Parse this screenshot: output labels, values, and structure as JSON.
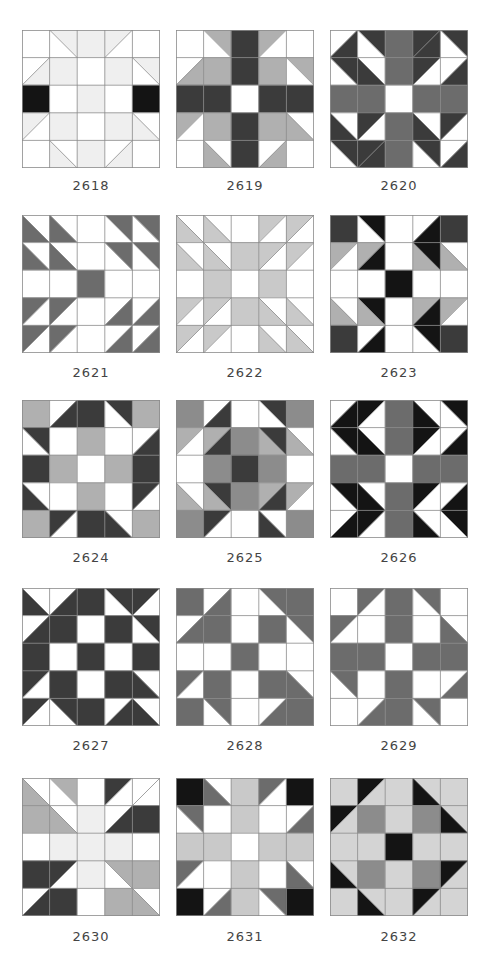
{
  "palette": {
    "W": "#ffffff",
    "L": "#efefef",
    "G": "#b0b0b0",
    "M": "#6c6c6c",
    "D": "#3b3b3b",
    "K": "#141414",
    "S": "#c9c9c9",
    "P": "#d4d4d4",
    "Q": "#8c8c8c",
    "grid": "#8a8a8a"
  },
  "blocks": [
    {
      "id": "2618",
      "label": "2618",
      "cells": [
        [
          "W",
          "L\\W",
          "L",
          "L/W",
          "W"
        ],
        [
          "W/L",
          "L",
          "W",
          "L",
          "L\\W"
        ],
        [
          "K",
          "W",
          "L",
          "W",
          "K"
        ],
        [
          "L/W",
          "L",
          "W",
          "L",
          "W\\L"
        ],
        [
          "W",
          "W\\L",
          "L",
          "W/L",
          "W"
        ]
      ]
    },
    {
      "id": "2619",
      "label": "2619",
      "cells": [
        [
          "W",
          "G\\W",
          "D",
          "G/W",
          "W"
        ],
        [
          "W/G",
          "G",
          "D",
          "G",
          "G\\W"
        ],
        [
          "D",
          "D",
          "W",
          "D",
          "D"
        ],
        [
          "G/W",
          "G",
          "D",
          "G",
          "W\\G"
        ],
        [
          "W",
          "W\\G",
          "D",
          "W/G",
          "W"
        ]
      ]
    },
    {
      "id": "2620",
      "label": "2620",
      "cells": [
        [
          "W/D",
          "D\\W",
          "M",
          "D/D",
          "D\\W"
        ],
        [
          "D\\W",
          "W\\D",
          "M",
          "D/W",
          "W/D"
        ],
        [
          "M",
          "M",
          "W",
          "M",
          "M"
        ],
        [
          "W\\D",
          "D/W",
          "M",
          "W\\D",
          "D/W"
        ],
        [
          "D\\W",
          "D/D",
          "M",
          "D\\W",
          "W/D"
        ]
      ]
    },
    {
      "id": "2621",
      "label": "2621",
      "cells": [
        [
          "W\\M",
          "W\\M",
          "W",
          "M\\W",
          "M\\W"
        ],
        [
          "W\\M",
          "W\\M",
          "W",
          "M\\W",
          "M\\W"
        ],
        [
          "W",
          "W",
          "M",
          "W",
          "W"
        ],
        [
          "M/W",
          "M/W",
          "W",
          "W/M",
          "W/M"
        ],
        [
          "M/W",
          "M/W",
          "W",
          "W/M",
          "W/M"
        ]
      ]
    },
    {
      "id": "2622",
      "label": "2622",
      "cells": [
        [
          "W\\S",
          "W\\S",
          "W",
          "S/W",
          "S/W"
        ],
        [
          "W\\S",
          "W\\S",
          "S",
          "S/W",
          "S/W"
        ],
        [
          "W",
          "S",
          "W",
          "S",
          "W"
        ],
        [
          "S/W",
          "S/W",
          "S",
          "W\\S",
          "W\\S"
        ],
        [
          "S/W",
          "S/W",
          "W",
          "W\\S",
          "W\\S"
        ]
      ]
    },
    {
      "id": "2623",
      "label": "2623",
      "cells": [
        [
          "D",
          "K\\W",
          "W",
          "W/K",
          "D"
        ],
        [
          "G/W",
          "G/K",
          "W",
          "K\\G",
          "W\\G"
        ],
        [
          "W",
          "W",
          "K",
          "W",
          "W"
        ],
        [
          "W\\G",
          "K\\G",
          "W",
          "G/K",
          "G/W"
        ],
        [
          "D",
          "W/K",
          "W",
          "K\\W",
          "D"
        ]
      ]
    },
    {
      "id": "2624",
      "label": "2624",
      "cells": [
        [
          "G",
          "W/D",
          "D",
          "D\\W",
          "G"
        ],
        [
          "D\\W",
          "W",
          "G",
          "W",
          "W/D"
        ],
        [
          "D",
          "G",
          "W",
          "G",
          "D"
        ],
        [
          "W\\D",
          "W",
          "G",
          "W",
          "D/W"
        ],
        [
          "G",
          "D/W",
          "D",
          "W\\D",
          "G"
        ]
      ]
    },
    {
      "id": "2625",
      "label": "2625",
      "cells": [
        [
          "Q",
          "W/D",
          "W",
          "D\\W",
          "Q"
        ],
        [
          "G/W",
          "G/D",
          "Q",
          "D\\G",
          "W\\G"
        ],
        [
          "W",
          "Q",
          "D",
          "Q",
          "W"
        ],
        [
          "W\\G",
          "D\\G",
          "Q",
          "G/D",
          "G/W"
        ],
        [
          "Q",
          "D/W",
          "W",
          "W\\D",
          "Q"
        ]
      ]
    },
    {
      "id": "2626",
      "label": "2626",
      "cells": [
        [
          "W/K",
          "K/W",
          "M",
          "W\\K",
          "K\\W"
        ],
        [
          "K\\W",
          "W\\K",
          "M",
          "K/W",
          "W/K"
        ],
        [
          "M",
          "M",
          "W",
          "M",
          "M"
        ],
        [
          "K\\W",
          "W\\K",
          "M",
          "K/W",
          "W/K"
        ],
        [
          "W/K",
          "K/W",
          "M",
          "W\\K",
          "K\\W"
        ]
      ]
    },
    {
      "id": "2627",
      "label": "2627",
      "cells": [
        [
          "W\\D",
          "W/D",
          "D",
          "D\\W",
          "D/W"
        ],
        [
          "W/D",
          "D",
          "W",
          "D",
          "D\\W"
        ],
        [
          "D",
          "W",
          "D",
          "W",
          "D"
        ],
        [
          "D/W",
          "D",
          "W",
          "D",
          "W\\D"
        ],
        [
          "D/W",
          "D\\W",
          "D",
          "W/D",
          "W\\D"
        ]
      ]
    },
    {
      "id": "2628",
      "label": "2628",
      "cells": [
        [
          "M",
          "W/M",
          "W",
          "M\\W",
          "M"
        ],
        [
          "W/M",
          "M",
          "W",
          "M",
          "M\\W"
        ],
        [
          "W",
          "W",
          "M",
          "W",
          "W"
        ],
        [
          "M/W",
          "M",
          "W",
          "M",
          "W\\M"
        ],
        [
          "M",
          "M\\W",
          "W",
          "W/M",
          "M"
        ]
      ]
    },
    {
      "id": "2629",
      "label": "2629",
      "cells": [
        [
          "W",
          "M/W",
          "M",
          "M\\W",
          "W"
        ],
        [
          "M/W",
          "W",
          "M",
          "W",
          "W\\M"
        ],
        [
          "M",
          "M",
          "W",
          "M",
          "M"
        ],
        [
          "M\\W",
          "W",
          "M",
          "W",
          "W/M"
        ],
        [
          "W",
          "W/M",
          "M",
          "M\\W",
          "W"
        ]
      ]
    },
    {
      "id": "2630",
      "label": "2630",
      "cells": [
        [
          "W\\G",
          "G\\W",
          "W",
          "D/W",
          "W/W"
        ],
        [
          "G",
          "W\\G",
          "L",
          "W/D",
          "D"
        ],
        [
          "W",
          "L",
          "L",
          "L",
          "W"
        ],
        [
          "D",
          "D/W",
          "L",
          "G\\W",
          "G"
        ],
        [
          "W/D",
          "D",
          "W",
          "G",
          "W\\G"
        ]
      ]
    },
    {
      "id": "2631",
      "label": "2631",
      "cells": [
        [
          "K",
          "W\\M",
          "S",
          "M/W",
          "K"
        ],
        [
          "M\\W",
          "W",
          "S",
          "W",
          "W/M"
        ],
        [
          "S",
          "S",
          "W",
          "S",
          "S"
        ],
        [
          "M/W",
          "W",
          "S",
          "W",
          "W\\M"
        ],
        [
          "K",
          "W/M",
          "S",
          "M\\W",
          "K"
        ]
      ]
    },
    {
      "id": "2632",
      "label": "2632",
      "cells": [
        [
          "P",
          "K/P",
          "P",
          "P\\K",
          "P"
        ],
        [
          "K/P",
          "Q",
          "P",
          "Q",
          "P\\K"
        ],
        [
          "P",
          "P",
          "K",
          "P",
          "P"
        ],
        [
          "P\\K",
          "Q",
          "P",
          "Q",
          "K/P"
        ],
        [
          "P",
          "P\\K",
          "P",
          "K/P",
          "P"
        ]
      ]
    }
  ],
  "layout": {
    "cols_x": [
      22,
      176,
      330
    ],
    "rows_y": [
      30,
      215,
      400,
      588,
      778
    ],
    "labels_y": [
      178,
      365,
      550,
      738,
      929
    ]
  }
}
